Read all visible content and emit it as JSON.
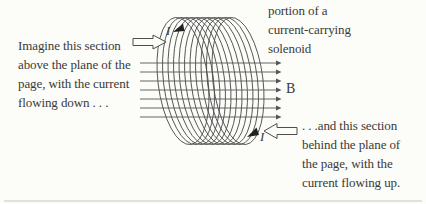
{
  "figure": {
    "title": "portion of a current-carrying solenoid"
  },
  "labels": {
    "field": "B",
    "current_top": "I",
    "current_bottom": "I"
  },
  "annotations": {
    "top_right": {
      "lines": [
        "portion of a",
        "current-carrying",
        "solenoid"
      ]
    },
    "left": {
      "lines": [
        "Imagine this section",
        "above the plane of the",
        "page, with the current",
        "flowing down . . ."
      ]
    },
    "bottom_right": {
      "lines": [
        ". . .and this section",
        "behind the plane of",
        "the page, with the",
        "current flowing up."
      ]
    }
  },
  "diagram": {
    "coil": {
      "loops": 11,
      "cx_start": 183,
      "cx_end": 238,
      "cy": 81,
      "rx": 25,
      "ry": 64,
      "tilt_deg": -7,
      "color": "#4d4d4d"
    },
    "field_lines": {
      "count": 7,
      "x_start": 140,
      "x_end": 276,
      "y_start": 63,
      "y_step": 9,
      "direction": "right",
      "color": "#555555"
    },
    "colors": {
      "background": "#fcfcf8",
      "text": "#3a3a38",
      "rule": "#c8c8c2"
    }
  }
}
